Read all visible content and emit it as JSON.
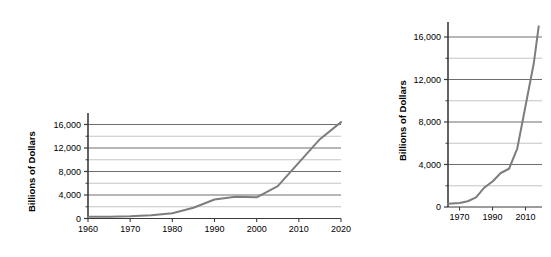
{
  "figure": {
    "background": "#ffffff",
    "line_color": "#7d7d7d",
    "axis_color": "#3b3b3b",
    "gridline_major_color": "#6e6e6e",
    "gridline_minor_color": "#bdbdbd"
  },
  "chart_data": [
    {
      "id": "left",
      "type": "line",
      "title": "",
      "xlabel": "",
      "ylabel": "Billions of Dollars",
      "xlim": [
        1960,
        2020
      ],
      "ylim": [
        0,
        17500
      ],
      "grid": true,
      "legend": "none",
      "xticks": [
        "1960",
        "1970",
        "1980",
        "1990",
        "2000",
        "2010",
        "2020"
      ],
      "xtick_values": [
        1960,
        1970,
        1980,
        1990,
        2000,
        2010,
        2020
      ],
      "yticks": [
        "0",
        "4,000",
        "8,000",
        "12,000",
        "16,000"
      ],
      "ytick_values": [
        0,
        4000,
        8000,
        12000,
        16000
      ],
      "yticks_minor_values": [
        2000,
        6000,
        10000,
        14000
      ],
      "x": [
        1960,
        1965,
        1970,
        1975,
        1980,
        1985,
        1990,
        1995,
        2000,
        2005,
        2010,
        2015,
        2020
      ],
      "values": [
        286,
        317,
        381,
        542,
        908,
        1823,
        3233,
        4974,
        5674,
        7933,
        13562,
        18151,
        16400
      ],
      "series": [
        {
          "name": "Gross Federal Debt",
          "values": [
            286,
            317,
            381,
            542,
            908,
            1823,
            3233,
            3700,
            3600,
            5500,
            9500,
            13500,
            16400
          ]
        }
      ]
    },
    {
      "id": "right",
      "type": "line",
      "title": "",
      "xlabel": "",
      "ylabel": "Billions of Dollars",
      "xlim": [
        1963,
        2020
      ],
      "ylim": [
        0,
        17500
      ],
      "grid": true,
      "legend": "none",
      "xticks": [
        "1970",
        "1990",
        "2010"
      ],
      "xtick_values": [
        1970,
        1990,
        2010
      ],
      "yticks": [
        "0",
        "4,000",
        "8,000",
        "12,000",
        "16,000"
      ],
      "ytick_values": [
        0,
        4000,
        8000,
        12000,
        16000
      ],
      "yticks_minor_values": [
        2000,
        6000,
        10000,
        14000
      ],
      "x": [
        1963,
        1970,
        1975,
        1980,
        1985,
        1990,
        1995,
        2000,
        2005,
        2010,
        2015,
        2018
      ],
      "series": [
        {
          "name": "Gross Federal Debt",
          "values": [
            300,
            381,
            542,
            908,
            1823,
            2400,
            3200,
            3600,
            5500,
            9500,
            13500,
            17000
          ]
        }
      ]
    }
  ]
}
